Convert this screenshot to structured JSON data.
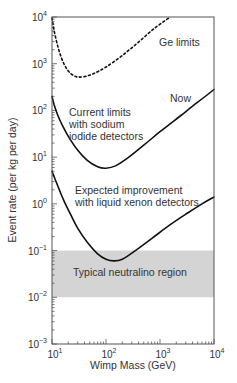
{
  "chart_data": {
    "type": "line",
    "title": "",
    "xlabel": "Wimp Mass (GeV)",
    "ylabel": "Event rate (per kg per day)",
    "xscale": "log",
    "yscale": "log",
    "xlim": [
      10,
      10000
    ],
    "ylim": [
      0.001,
      10000
    ],
    "grid": false,
    "legend": "none (inline annotations)",
    "x_ticks": [
      {
        "value": 10,
        "base": "10",
        "exp": "1"
      },
      {
        "value": 100,
        "base": "10",
        "exp": "2"
      },
      {
        "value": 1000,
        "base": "10",
        "exp": "3"
      },
      {
        "value": 10000,
        "base": "10",
        "exp": "4"
      }
    ],
    "y_ticks": [
      {
        "value": 10000,
        "base": "10",
        "exp": "4"
      },
      {
        "value": 1000,
        "base": "10",
        "exp": "3"
      },
      {
        "value": 100,
        "base": "10",
        "exp": "2"
      },
      {
        "value": 10,
        "base": "10",
        "exp": "1"
      },
      {
        "value": 1,
        "base": "10",
        "exp": "0"
      },
      {
        "value": 0.1,
        "base": "10",
        "exp": "−1"
      },
      {
        "value": 0.01,
        "base": "10",
        "exp": "−2"
      },
      {
        "value": 0.001,
        "base": "10",
        "exp": "−3"
      }
    ],
    "series": [
      {
        "name": "Ge limits",
        "style": "dotted",
        "x": [
          10,
          11,
          13,
          16,
          20,
          25,
          30,
          40,
          60,
          100,
          200,
          400,
          800,
          1550
        ],
        "y": [
          9500,
          5000,
          2200,
          1100,
          700,
          560,
          520,
          530,
          620,
          850,
          1500,
          2900,
          5800,
          10000
        ]
      },
      {
        "name": "Current limits with sodium iodide detectors",
        "annotation_right": "Now",
        "style": "solid",
        "x": [
          10,
          11,
          13,
          16,
          20,
          30,
          45,
          70,
          100,
          150,
          250,
          500,
          1000,
          2500,
          5000,
          10000
        ],
        "y": [
          200,
          130,
          75,
          45,
          28,
          14,
          8.5,
          6.2,
          5.8,
          6.5,
          9.5,
          18,
          35,
          80,
          150,
          280
        ]
      },
      {
        "name": "Expected improvement with liquid xenon detectors",
        "style": "solid",
        "x": [
          10,
          13,
          17,
          22,
          30,
          45,
          70,
          100,
          140,
          200,
          350,
          700,
          1500,
          3000,
          6000,
          10000
        ],
        "y": [
          5,
          2.3,
          1.1,
          0.6,
          0.3,
          0.15,
          0.085,
          0.065,
          0.06,
          0.065,
          0.1,
          0.18,
          0.35,
          0.6,
          1.0,
          1.4
        ]
      }
    ],
    "regions": [
      {
        "name": "Typical neutralino region",
        "y_min": 0.01,
        "y_max": 0.1,
        "x_min": 10,
        "x_max": 10000,
        "color": "#d4d4d4"
      }
    ],
    "annotations": [
      {
        "text": "Ge limits",
        "lines": [
          "Ge limits"
        ]
      },
      {
        "text": "Now",
        "lines": [
          "Now"
        ]
      },
      {
        "text": "Current limits with sodium iodide detectors",
        "lines": [
          "Current limits",
          "with sodium",
          "iodide detectors"
        ]
      },
      {
        "text": "Expected improvement with liquid xenon detectors",
        "lines": [
          "Expected improvement",
          "with liquid xenon detectors"
        ]
      },
      {
        "text": "Typical neutralino region",
        "lines": [
          "Typical neutralino region"
        ]
      }
    ]
  },
  "labels": {
    "ge": "Ge limits",
    "now": "Now",
    "nai_1": "Current limits",
    "nai_2": "with sodium",
    "nai_3": "iodide detectors",
    "xe_1": "Expected improvement",
    "xe_2": "with liquid xenon detectors",
    "region": "Typical neutralino region",
    "xlabel": "Wimp Mass (GeV)",
    "ylabel": "Event rate (per kg per day)"
  },
  "colors": {
    "curve": "#111111",
    "band": "#d4d4d4",
    "frame": "#555555",
    "text": "#333333"
  }
}
